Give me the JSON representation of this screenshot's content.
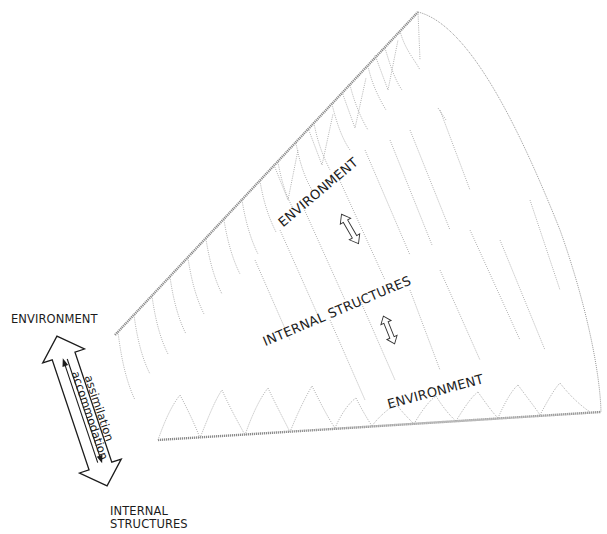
{
  "diagram": {
    "type": "conceptual cone / spiral diagram",
    "cone": {
      "labels": {
        "upper": "ENVIRONMENT",
        "middle": "INTERNAL STRUCTURES",
        "lower": "ENVIRONMENT"
      },
      "small_arrows": [
        {
          "id": "upper-double-arrow",
          "meaning": "environment-internal exchange"
        },
        {
          "id": "lower-double-arrow",
          "meaning": "internal-environment exchange"
        }
      ],
      "texture_color": "#9a9a9a"
    },
    "side_arrow": {
      "top_label": "ENVIRONMENT",
      "bottom_label_line1": "INTERNAL",
      "bottom_label_line2": "STRUCTURES",
      "inner_right_label": "assimilation",
      "inner_left_label": "accommodation"
    },
    "colors": {
      "ink": "#1c1c1c",
      "dotted_line": "#9a9a9a",
      "background": "#ffffff"
    }
  }
}
